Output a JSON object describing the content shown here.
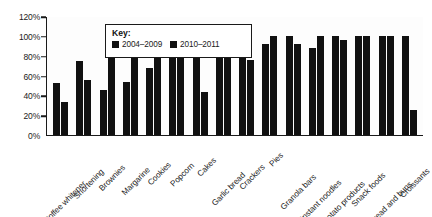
{
  "chart_data": {
    "type": "bar",
    "title": "",
    "xlabel": "",
    "ylabel": "",
    "ylim": [
      0,
      120
    ],
    "grid": false,
    "legend_position": "inside-top-left",
    "legend_title": "Key:",
    "ytick_labels": [
      "120%",
      "100%",
      "80%",
      "60%",
      "40%",
      "20%",
      "0%"
    ],
    "ytick_values": [
      120,
      100,
      80,
      60,
      40,
      20,
      0
    ],
    "categories": [
      "Coffee whitener",
      "Shortening",
      "Brownies",
      "Margarine",
      "Cookies",
      "Popcorn",
      "Cakes",
      "Garlic bread",
      "Crackers",
      "Pies",
      "Granola bars",
      "Instant noodles",
      "Potato products",
      "Snack foods",
      "Bread and buns",
      "Croissants"
    ],
    "series": [
      {
        "name": "2004–2009",
        "color": "#111111",
        "values": [
          52,
          75,
          45,
          53,
          68,
          82,
          90,
          96,
          100,
          92,
          100,
          88,
          100,
          100,
          100,
          100
        ]
      },
      {
        "name": "2010–2011",
        "color": "#111111",
        "values": [
          33,
          55,
          84,
          85,
          88,
          88,
          43,
          100,
          76,
          100,
          92,
          100,
          96,
          100,
          100,
          25
        ]
      }
    ]
  }
}
